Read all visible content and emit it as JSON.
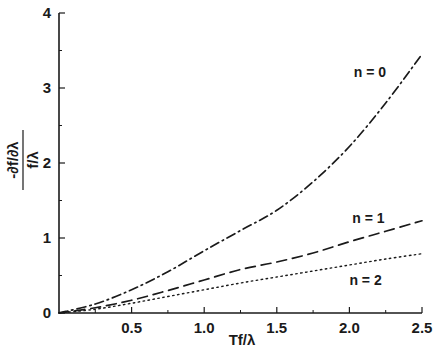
{
  "chart_data": {
    "type": "line",
    "title": "",
    "xlabel": "Tf/λ",
    "ylabel_numerator": "-∂f/∂λ",
    "ylabel_denominator": "f/λ",
    "xlim": [
      0,
      2.5
    ],
    "ylim": [
      0,
      4
    ],
    "grid": false,
    "legend_position": "inline labels at right end of curves",
    "x_ticks": [
      {
        "value": 0.5,
        "label": "0.5"
      },
      {
        "value": 1.0,
        "label": "1.0"
      },
      {
        "value": 1.5,
        "label": "1.5"
      },
      {
        "value": 2.0,
        "label": "2.0"
      },
      {
        "value": 2.5,
        "label": "2.5"
      }
    ],
    "x_minor_ticks": [
      0.25,
      0.75,
      1.25,
      1.75,
      2.25
    ],
    "y_ticks": [
      {
        "value": 0,
        "label": "0"
      },
      {
        "value": 1,
        "label": "1"
      },
      {
        "value": 2,
        "label": "2"
      },
      {
        "value": 3,
        "label": "3"
      },
      {
        "value": 4,
        "label": "4"
      }
    ],
    "y_minor_ticks": [
      0.5,
      1.5,
      2.5,
      3.5
    ],
    "x": [
      0,
      0.25,
      0.5,
      0.75,
      1.0,
      1.25,
      1.5,
      1.75,
      2.0,
      2.25,
      2.5
    ],
    "series": [
      {
        "name": "n = 0",
        "style": "dash-dot",
        "values": [
          0,
          0.12,
          0.31,
          0.55,
          0.83,
          1.1,
          1.37,
          1.75,
          2.22,
          2.8,
          3.45
        ],
        "label_pos": {
          "x": 2.03,
          "y": 3.15
        }
      },
      {
        "name": "n = 1",
        "style": "dashed",
        "values": [
          0,
          0.07,
          0.17,
          0.3,
          0.44,
          0.58,
          0.68,
          0.8,
          0.95,
          1.09,
          1.23
        ],
        "label_pos": {
          "x": 2.02,
          "y": 1.2
        }
      },
      {
        "name": "n = 2",
        "style": "dotted",
        "values": [
          0,
          0.05,
          0.13,
          0.22,
          0.31,
          0.4,
          0.48,
          0.56,
          0.64,
          0.72,
          0.79
        ],
        "label_pos": {
          "x": 2.0,
          "y": 0.38
        }
      }
    ],
    "colors": {
      "line": "#1a1a1a",
      "background": "#ffffff"
    }
  }
}
